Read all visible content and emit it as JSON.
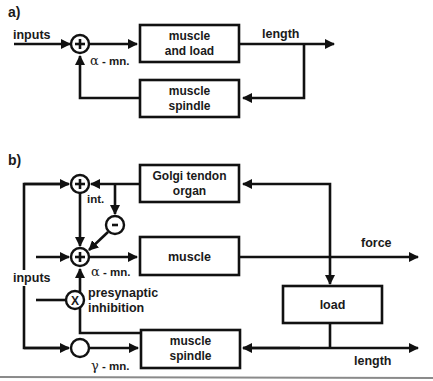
{
  "panel_a": {
    "label": "a)",
    "input_label": "inputs",
    "junction_symbol": "+",
    "alpha_label_greek": "α",
    "alpha_label_rest": " - mn.",
    "blocks": {
      "muscle_and_load": {
        "line1": "muscle",
        "line2": "and load"
      },
      "muscle_spindle": {
        "line1": "muscle",
        "line2": "spindle"
      }
    },
    "output_label": "length"
  },
  "panel_b": {
    "label": "b)",
    "input_label": "inputs",
    "junctions": {
      "top": "+",
      "minus": "-",
      "alpha": "+",
      "presynaptic": "X",
      "gamma": ""
    },
    "int_label": "int.",
    "alpha_label_greek": "α",
    "alpha_label_rest": " - mn.",
    "gamma_label_greek": "γ",
    "gamma_label_rest": " - mn.",
    "presynaptic_line1": "presynaptic",
    "presynaptic_line2": "inhibition",
    "blocks": {
      "golgi": {
        "line1": "Golgi tendon",
        "line2": "organ"
      },
      "muscle": {
        "line1": "muscle"
      },
      "load": {
        "line1": "load"
      },
      "spindle": {
        "line1": "muscle",
        "line2": "spindle"
      }
    },
    "force_label": "force",
    "length_label": "length"
  },
  "colors": {
    "ink": "#111111",
    "background": "#ffffff",
    "separator": "#8a8a8a"
  }
}
